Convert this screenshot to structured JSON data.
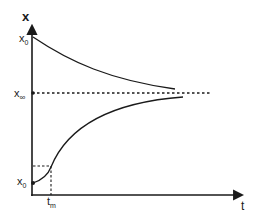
{
  "diagram": {
    "type": "kinetic-curves",
    "axes": {
      "y_label": "x",
      "x_label": "t"
    },
    "labels": {
      "upper_start": {
        "base": "x",
        "sub": "0"
      },
      "asymptote": {
        "base": "x",
        "sub": "∞"
      },
      "lower_start": {
        "base": "x",
        "sub": "0"
      },
      "inflection_time": {
        "base": "t",
        "sub": "m"
      }
    },
    "curves": [
      {
        "name": "decreasing-curve",
        "from": "x0 (high)",
        "to": "x∞",
        "shape": "exponential decay"
      },
      {
        "name": "increasing-curve",
        "from": "x0 (low)",
        "to": "x∞",
        "shape": "sigmoidal with inflection at tm"
      }
    ],
    "reference_lines": [
      {
        "name": "asymptote-line",
        "style": "dotted",
        "value": "x∞"
      },
      {
        "name": "inflection-guides",
        "style": "dashed",
        "at": "tm"
      }
    ],
    "colors": {
      "stroke": "#1a1a1a",
      "background": "#ffffff"
    }
  }
}
